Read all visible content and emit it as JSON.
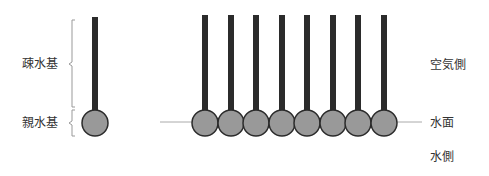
{
  "diagram": {
    "labels": {
      "hydrophobic": "疎水基",
      "hydrophilic": "親水基",
      "air_side": "空気側",
      "water_surface": "水面",
      "water_side": "水側"
    },
    "colors": {
      "tail": "#2b2b2b",
      "head_fill": "#999999",
      "head_stroke": "#2b2b2b",
      "water_line": "#aaaaaa",
      "brace": "#999999",
      "text": "#333333"
    },
    "single_molecule": {
      "x": 95,
      "head_y": 123,
      "tail_top": 17
    },
    "monolayer": {
      "count": 8,
      "xs": [
        205,
        231,
        256,
        282,
        307,
        333,
        358,
        384
      ],
      "head_y": 123,
      "tail_top": 15
    }
  }
}
